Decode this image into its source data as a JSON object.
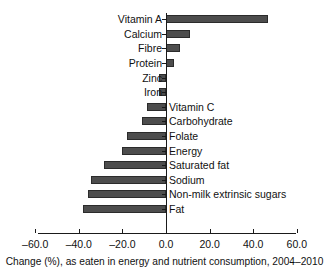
{
  "caption": "Change (%), as eaten in energy and nutrient consumption, 2004–2010",
  "axis": {
    "tick_labels": [
      "–60.0",
      "–40.0",
      "–20.0",
      "0.0",
      "20.0",
      "40.0",
      "60.0"
    ],
    "tick_values": [
      -60,
      -40,
      -20,
      0,
      20,
      40,
      60
    ]
  },
  "colors": {
    "bar_fill": "#4d4d4d",
    "bar_stroke": "#2b2b2b",
    "axis": "#1a1a1a",
    "text": "#111111",
    "background": "#ffffff"
  },
  "chart_data": {
    "type": "bar",
    "orientation": "horizontal",
    "title": "",
    "subtitle": "",
    "xlabel": "Change (%), as eaten in energy and nutrient consumption, 2004–2010",
    "ylabel": "",
    "xlim": [
      -60,
      60
    ],
    "ylim": null,
    "grid": false,
    "legend": null,
    "categories": [
      "Vitamin A",
      "Calcium",
      "Fibre",
      "Protein",
      "Zinc",
      "Iron",
      "Vitamin C",
      "Carbohydrate",
      "Folate",
      "Energy",
      "Saturated fat",
      "Sodium",
      "Non-milk extrinsic sugars",
      "Fat"
    ],
    "values": [
      47.0,
      11.0,
      6.4,
      3.6,
      -3.0,
      -3.0,
      -8.6,
      -11.0,
      -18.0,
      -20.0,
      -28.5,
      -34.5,
      -36.0,
      -38.0
    ]
  },
  "bars": [
    {
      "label": "Vitamin A",
      "value": 47.0,
      "label_side": "left"
    },
    {
      "label": "Calcium",
      "value": 11.0,
      "label_side": "left"
    },
    {
      "label": "Fibre",
      "value": 6.4,
      "label_side": "left"
    },
    {
      "label": "Protein",
      "value": 3.6,
      "label_side": "left"
    },
    {
      "label": "Zinc",
      "value": -3.0,
      "label_side": "left"
    },
    {
      "label": "Iron",
      "value": -3.0,
      "label_side": "left"
    },
    {
      "label": "Vitamin C",
      "value": -8.6,
      "label_side": "right"
    },
    {
      "label": "Carbohydrate",
      "value": -11.0,
      "label_side": "right"
    },
    {
      "label": "Folate",
      "value": -18.0,
      "label_side": "right"
    },
    {
      "label": "Energy",
      "value": -20.0,
      "label_side": "right"
    },
    {
      "label": "Saturated fat",
      "value": -28.5,
      "label_side": "right"
    },
    {
      "label": "Sodium",
      "value": -34.5,
      "label_side": "right"
    },
    {
      "label": "Non-milk extrinsic sugars",
      "value": -36.0,
      "label_side": "right"
    },
    {
      "label": "Fat",
      "value": -38.0,
      "label_side": "right"
    }
  ],
  "layout": {
    "zero_x": 166,
    "px_per_unit": 2.18,
    "row_top": 12,
    "row_height": 14.6,
    "axis_y": 233,
    "axis_left_x": 38,
    "axis_right_x": 296
  }
}
